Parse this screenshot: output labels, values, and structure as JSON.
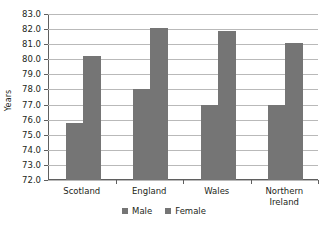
{
  "chart_data": {
    "type": "bar",
    "title": "",
    "xlabel": "",
    "ylabel": "Years",
    "categories": [
      "Scotland",
      "England",
      "Wales",
      "Northern Ireland"
    ],
    "series": [
      {
        "name": "Male",
        "values": [
          75.8,
          78.0,
          77.0,
          77.0
        ],
        "color": "#757575"
      },
      {
        "name": "Female",
        "values": [
          80.2,
          82.1,
          81.9,
          81.1
        ],
        "color": "#757575"
      }
    ],
    "ylim": [
      72.0,
      83.0
    ],
    "ytick_labels": [
      "83.0",
      "82.0",
      "81.0",
      "80.0",
      "79.0",
      "78.0",
      "77.0",
      "76.0",
      "75.0",
      "74.0",
      "73.0",
      "72.0"
    ],
    "ytick_values": [
      83.0,
      82.0,
      81.0,
      80.0,
      79.0,
      78.0,
      77.0,
      76.0,
      75.0,
      74.0,
      73.0,
      72.0
    ],
    "grid": true,
    "grid_axis": "y",
    "legend_position": "bottom",
    "legend_entries": [
      "Male",
      "Female"
    ],
    "category_label_lines": [
      [
        "Scotland"
      ],
      [
        "England"
      ],
      [
        "Wales"
      ],
      [
        "Northern",
        "Ireland"
      ]
    ]
  }
}
